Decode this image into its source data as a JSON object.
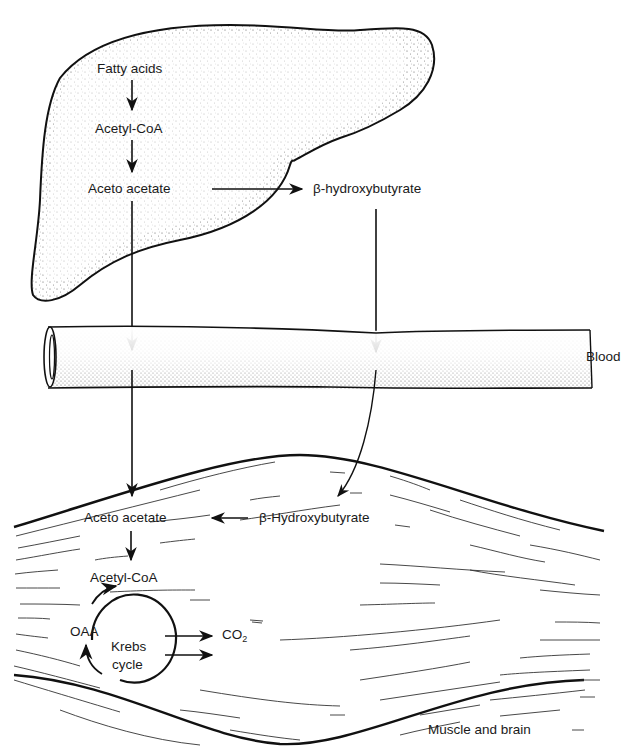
{
  "diagram": {
    "liver": {
      "fatty_acids": "Fatty acids",
      "acetyl_coa": "Acetyl-CoA",
      "aceto_acetate": "Aceto acetate",
      "beta_hydroxybutyrate": "β-hydroxybutyrate"
    },
    "blood": {
      "label": "Blood"
    },
    "muscle": {
      "aceto_acetate": "Aceto acetate",
      "beta_hydroxybutyrate": "β-Hydroxybutyrate",
      "acetyl_coa": "Acetyl-CoA",
      "oaa": "OAA",
      "krebs_line1": "Krebs",
      "krebs_line2": "cycle",
      "co2": "CO",
      "co2_sub": "2",
      "label": "Muscle and brain"
    }
  }
}
